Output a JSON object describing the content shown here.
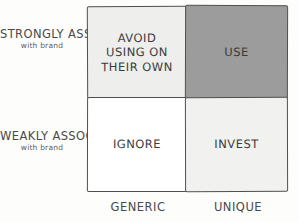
{
  "diagram": {
    "y_axis": {
      "top": {
        "main": "STRONGLY ASSOCIATED",
        "sub": "with brand"
      },
      "bottom": {
        "main": "WEAKLY ASSOCIATED",
        "sub": "with brand"
      }
    },
    "x_axis": {
      "left": "GENERIC",
      "right": "UNIQUE"
    },
    "quadrants": [
      {
        "id": "avoid",
        "label": "AVOID USING ON THEIR OWN",
        "lines": [
          "AVOID",
          "USING ON",
          "THEIR OWN"
        ],
        "fill": "#eeeeec",
        "row": "strongly-associated",
        "col": "generic"
      },
      {
        "id": "use",
        "label": "USE",
        "lines": [
          "USE"
        ],
        "fill": "#9c9c9c",
        "row": "strongly-associated",
        "col": "unique"
      },
      {
        "id": "ignore",
        "label": "IGNORE",
        "lines": [
          "IGNORE"
        ],
        "fill": "#ffffff",
        "row": "weakly-associated",
        "col": "generic"
      },
      {
        "id": "invest",
        "label": "INVEST",
        "lines": [
          "INVEST"
        ],
        "fill": "#f1f1ef",
        "row": "weakly-associated",
        "col": "unique"
      }
    ],
    "colors": {
      "stroke": "#4f4f4f",
      "text": "#3c3c3c",
      "background": "#fdfdfc"
    }
  }
}
